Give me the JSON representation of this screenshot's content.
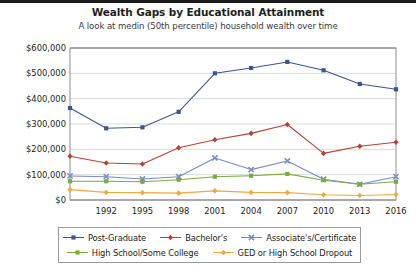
{
  "chart_data": {
    "type": "line",
    "title": "Wealth Gaps by Educational Attainment",
    "subtitle": "A look at medin (50th percentile) household wealth over time",
    "xlabel": "",
    "ylabel": "",
    "grid": true,
    "legend_position": "bottom",
    "ylim": [
      0,
      600000
    ],
    "yticks": [
      0,
      100000,
      200000,
      300000,
      400000,
      500000,
      600000
    ],
    "ytick_labels": [
      "$0",
      "$100,000",
      "$200,000",
      "$300,000",
      "$400,000",
      "$500,000",
      "$600,000"
    ],
    "x": [
      1989,
      1992,
      1995,
      1998,
      2001,
      2004,
      2007,
      2010,
      2013,
      2016
    ],
    "xtick_labels": [
      "1992",
      "1995",
      "1998",
      "2001",
      "2004",
      "2007",
      "2010",
      "2013",
      "2016"
    ],
    "xticks": [
      1992,
      1995,
      1998,
      2001,
      2004,
      2007,
      2010,
      2013,
      2016
    ],
    "series": [
      {
        "name": "Post-Graduate",
        "color": "#3d5691",
        "marker": "square",
        "values": [
          363000,
          283000,
          287000,
          348000,
          500000,
          521000,
          545000,
          512000,
          458000,
          437000
        ]
      },
      {
        "name": "Bachelor's",
        "color": "#b54334",
        "marker": "diamond",
        "values": [
          173000,
          146000,
          142000,
          206000,
          238000,
          263000,
          298000,
          184000,
          212000,
          228000
        ]
      },
      {
        "name": "Associate's/Certificate",
        "color": "#7b8ac4",
        "marker": "cross",
        "values": [
          95000,
          92000,
          83000,
          92000,
          166000,
          120000,
          154000,
          82000,
          62000,
          92000
        ]
      },
      {
        "name": "High School/Some College",
        "color": "#7aab42",
        "marker": "square",
        "values": [
          74000,
          74000,
          72000,
          80000,
          92000,
          96000,
          103000,
          78000,
          62000,
          72000
        ]
      },
      {
        "name": "GED or High School Dropout",
        "color": "#f0a93f",
        "marker": "diamond",
        "values": [
          41000,
          30000,
          29000,
          27000,
          36000,
          30000,
          29000,
          21000,
          18000,
          22000
        ]
      }
    ]
  }
}
